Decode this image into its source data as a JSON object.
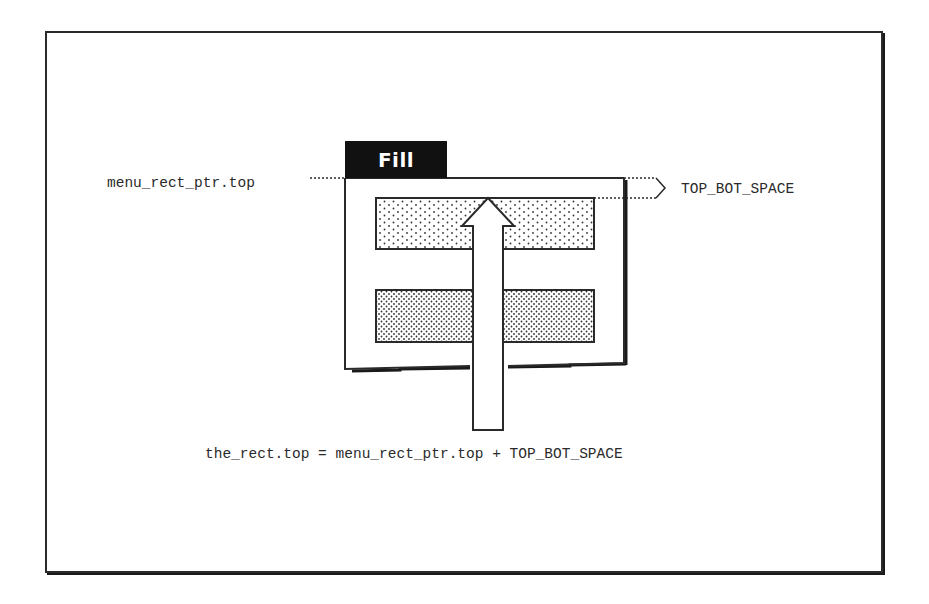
{
  "diagram": {
    "menu_tab_label": "Fill",
    "left_marker_label": "menu_rect_ptr.top",
    "right_marker_label": "TOP_BOT_SPACE",
    "formula": "the_rect.top = menu_rect_ptr.top + TOP_BOT_SPACE",
    "menu_items": [
      {
        "name": "menu-item-1",
        "pattern": "sparse-dots"
      },
      {
        "name": "menu-item-2",
        "pattern": "dense-dots"
      }
    ],
    "colors": {
      "ink": "#2a2a2a",
      "tab_bg": "#111111",
      "tab_text": "#ffffff",
      "background": "#ffffff"
    }
  }
}
